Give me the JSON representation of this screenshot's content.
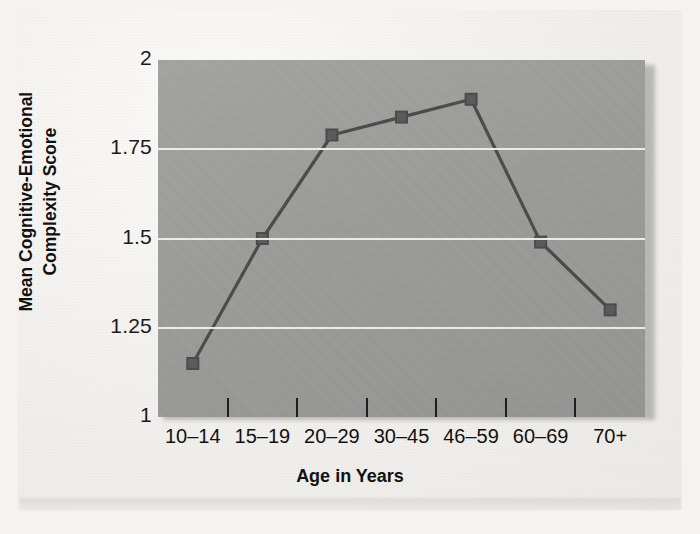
{
  "chart_data": {
    "type": "line",
    "title": "",
    "xlabel": "Age in Years",
    "ylabel": "Mean Cognitive-Emotional Complexity Score",
    "ylabel_line1": "Mean Cognitive-Emotional",
    "ylabel_line2": "Complexity Score",
    "categories": [
      "10–14",
      "15–19",
      "20–29",
      "30–45",
      "46–59",
      "60–69",
      "70+"
    ],
    "values": [
      1.15,
      1.5,
      1.79,
      1.84,
      1.89,
      1.49,
      1.3
    ],
    "series": [
      {
        "name": "Mean Cognitive-Emotional Complexity Score",
        "values": [
          1.15,
          1.5,
          1.79,
          1.84,
          1.89,
          1.49,
          1.3
        ]
      }
    ],
    "ylim": [
      1,
      2
    ],
    "yticks": [
      1,
      1.25,
      1.5,
      1.75,
      2
    ],
    "ytick_labels": [
      "1",
      "1.25",
      "1.5",
      "1.75",
      "2"
    ],
    "gridlines": [
      1.25,
      1.5,
      1.75
    ],
    "grid": true,
    "legend": "none",
    "marker": "square",
    "colors": {
      "plot_background": "#9b9b99",
      "gridline": "#f2f2f0",
      "line": "#4a4a4a",
      "marker": "#5a5a5a",
      "text": "#111111",
      "page_background": "#f1efec"
    }
  },
  "axis": {
    "y_title_line1": "Mean Cognitive-Emotional",
    "y_title_line2": "Complexity Score",
    "x_title": "Age in Years"
  }
}
